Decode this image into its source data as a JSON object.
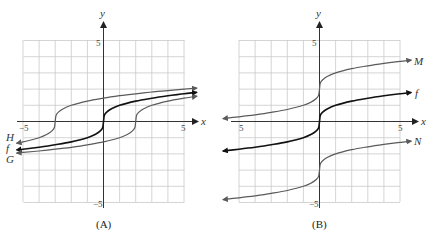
{
  "chart_data": [
    {
      "type": "line",
      "panel_label": "(A)",
      "title": "",
      "xlabel": "x",
      "ylabel": "y",
      "xlim": [
        -5,
        5
      ],
      "ylim": [
        -5,
        5
      ],
      "grid": true,
      "x_tick_labels": [
        "-5",
        "5"
      ],
      "y_tick_labels": [
        "5",
        "-5"
      ],
      "x_range_drawn": [
        -5.4,
        5.8
      ],
      "series": [
        {
          "name": "H",
          "expression": "cbrt(x+3)",
          "color": "#5a5a5a",
          "width": 1.2,
          "x": [
            -5.4,
            -5,
            -4.5,
            -4,
            -3.5,
            -3.2,
            -3.05,
            -3,
            -2.95,
            -2.8,
            -2.5,
            -2,
            -1,
            0,
            1,
            2,
            3,
            4,
            5,
            5.8
          ],
          "y": [
            -1.34,
            -1.26,
            -1.14,
            -1.0,
            -0.79,
            -0.58,
            -0.37,
            0,
            0.37,
            0.58,
            0.79,
            1.0,
            1.26,
            1.44,
            1.59,
            1.71,
            1.82,
            1.91,
            2.0,
            2.06
          ]
        },
        {
          "name": "f",
          "expression": "cbrt(x)",
          "color": "#111111",
          "width": 1.6,
          "x": [
            -5.4,
            -5,
            -4,
            -3,
            -2,
            -1,
            -0.5,
            -0.2,
            -0.05,
            0,
            0.05,
            0.2,
            0.5,
            1,
            2,
            3,
            4,
            5,
            5.8
          ],
          "y": [
            -1.75,
            -1.71,
            -1.59,
            -1.44,
            -1.26,
            -1.0,
            -0.79,
            -0.58,
            -0.37,
            0,
            0.37,
            0.58,
            0.79,
            1.0,
            1.26,
            1.44,
            1.59,
            1.71,
            1.8
          ]
        },
        {
          "name": "G",
          "expression": "cbrt(x-2)",
          "color": "#5a5a5a",
          "width": 1.2,
          "x": [
            -5.4,
            -5,
            -4,
            -3,
            -2,
            -1,
            0,
            1,
            1.5,
            1.8,
            1.95,
            2,
            2.05,
            2.2,
            2.5,
            3,
            4,
            5,
            5.8
          ],
          "y": [
            -1.95,
            -1.91,
            -1.82,
            -1.71,
            -1.59,
            -1.44,
            -1.26,
            -1.0,
            -0.79,
            -0.58,
            -0.37,
            0,
            0.37,
            0.58,
            0.79,
            1.0,
            1.26,
            1.44,
            1.56
          ]
        }
      ]
    },
    {
      "type": "line",
      "panel_label": "(B)",
      "title": "",
      "xlabel": "x",
      "ylabel": "y",
      "xlim": [
        -5,
        5
      ],
      "ylim": [
        -5,
        5
      ],
      "grid": true,
      "x_tick_labels": [
        "5",
        "5"
      ],
      "y_tick_labels": [
        "5",
        "-5"
      ],
      "x_range_drawn": [
        -6.0,
        5.7
      ],
      "series": [
        {
          "name": "M",
          "expression": "cbrt(x)+2",
          "color": "#5a5a5a",
          "width": 1.2,
          "x": [
            -6,
            -5,
            -4,
            -3,
            -2,
            -1,
            -0.5,
            -0.2,
            -0.05,
            0,
            0.05,
            0.2,
            0.5,
            1,
            2,
            3,
            4,
            5,
            5.7
          ],
          "y": [
            0.18,
            0.29,
            0.41,
            0.56,
            0.74,
            1.0,
            1.21,
            1.42,
            1.63,
            2,
            2.37,
            2.58,
            2.79,
            3.0,
            3.26,
            3.44,
            3.59,
            3.71,
            3.79
          ]
        },
        {
          "name": "f",
          "expression": "cbrt(x)",
          "color": "#111111",
          "width": 1.6,
          "x": [
            -6,
            -5,
            -4,
            -3,
            -2,
            -1,
            -0.5,
            -0.2,
            -0.05,
            0,
            0.05,
            0.2,
            0.5,
            1,
            2,
            3,
            4,
            5,
            5.7
          ],
          "y": [
            -1.82,
            -1.71,
            -1.59,
            -1.44,
            -1.26,
            -1.0,
            -0.79,
            -0.58,
            -0.37,
            0,
            0.37,
            0.58,
            0.79,
            1.0,
            1.26,
            1.44,
            1.59,
            1.71,
            1.79
          ]
        },
        {
          "name": "N",
          "expression": "cbrt(x)-3",
          "color": "#5a5a5a",
          "width": 1.2,
          "x": [
            -6,
            -5,
            -4,
            -3,
            -2,
            -1,
            -0.5,
            -0.2,
            -0.05,
            0,
            0.05,
            0.2,
            0.5,
            1,
            2,
            3,
            4,
            5,
            5.7
          ],
          "y": [
            -4.82,
            -4.71,
            -4.59,
            -4.44,
            -4.26,
            -4.0,
            -3.79,
            -3.58,
            -3.37,
            -3,
            -2.63,
            -2.42,
            -2.21,
            -2.0,
            -1.74,
            -1.56,
            -1.41,
            -1.29,
            -1.21
          ]
        }
      ]
    }
  ],
  "panels": {
    "a": {
      "caption": "(A)",
      "axis_x": "x",
      "axis_y": "y",
      "tick_x_neg": "−5",
      "tick_x_pos": "5",
      "tick_y_pos": "5",
      "tick_y_neg": "−5",
      "labels": {
        "H": "H",
        "f": "f",
        "G": "G"
      }
    },
    "b": {
      "caption": "(B)",
      "axis_x": "x",
      "axis_y": "y",
      "tick_x_neg": "5",
      "tick_x_pos": "5",
      "tick_y_pos": "5",
      "tick_y_neg": "−5",
      "labels": {
        "M": "M",
        "f": "f",
        "N": "N"
      }
    }
  },
  "colors": {
    "grid": "#c9c9c9",
    "axis": "#333333",
    "curve": "#5a5a5a",
    "primary": "#111111"
  }
}
